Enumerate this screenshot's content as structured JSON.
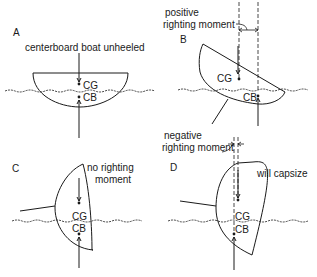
{
  "figure": {
    "panels": [
      {
        "id": "A",
        "letter": "A",
        "caption": "centerboard boat unheeled",
        "cg_label": "CG",
        "cb_label": "CB"
      },
      {
        "id": "B",
        "letter": "B",
        "caption_line1": "positive",
        "caption_line2": "righting moment",
        "cg_label": "CG",
        "cb_label": "CB"
      },
      {
        "id": "C",
        "letter": "C",
        "caption_line1": "no righting",
        "caption_line2": "moment",
        "cg_label": "CG",
        "cb_label": "CB"
      },
      {
        "id": "D",
        "letter": "D",
        "caption_line1": "negative",
        "caption_line2": "righting moment",
        "note": "will capsize",
        "cg_label": "CG",
        "cb_label": "CB"
      }
    ],
    "colors": {
      "ink": "#1a1a1a",
      "background": "#ffffff"
    }
  }
}
